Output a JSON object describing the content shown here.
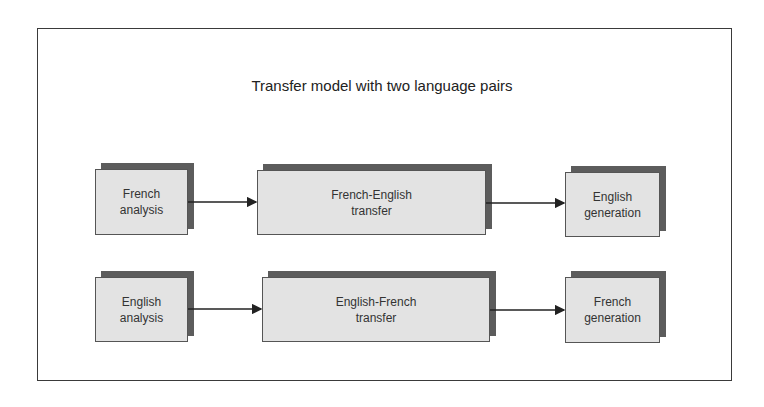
{
  "title": "Transfer model with two language pairs",
  "rows": [
    {
      "analysis": {
        "line1": "French",
        "line2": "analysis"
      },
      "transfer": {
        "line1": "French-English",
        "line2": "transfer"
      },
      "generation": {
        "line1": "English",
        "line2": "generation"
      }
    },
    {
      "analysis": {
        "line1": "English",
        "line2": "analysis"
      },
      "transfer": {
        "line1": "English-French",
        "line2": "transfer"
      },
      "generation": {
        "line1": "French",
        "line2": "generation"
      }
    }
  ],
  "colors": {
    "box_fill": "#e3e3e3",
    "box_shadow": "#5c5c5c",
    "border": "#3a3a3a"
  }
}
